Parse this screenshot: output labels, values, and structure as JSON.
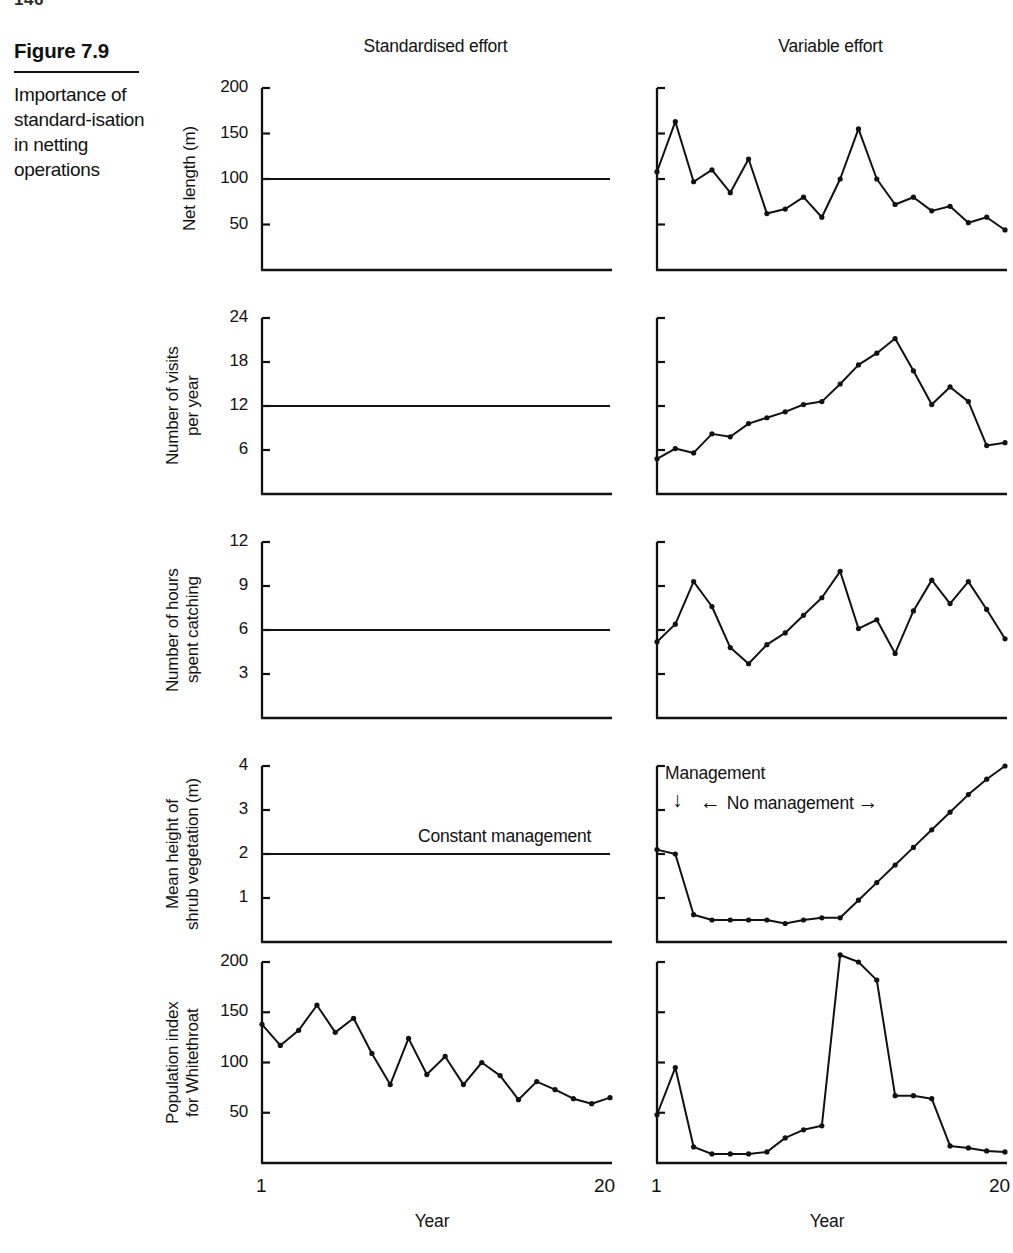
{
  "page_number_fragment": "146",
  "caption": {
    "figure_number": "Figure 7.9",
    "text": "Importance of standard-isation in netting operations"
  },
  "headers": {
    "left": "Standardised effort",
    "right": "Variable effort"
  },
  "xaxis": {
    "title": "Year",
    "first_tick": "1",
    "last_tick": "20"
  },
  "annotations": {
    "constant_management": "Constant management",
    "management": "Management",
    "no_management": "No management",
    "down_arrow": "↓",
    "left_arrow": "←",
    "right_arrow": "→"
  },
  "chart_data": [
    {
      "id": "net-length",
      "type": "line",
      "title": "",
      "ylabel": "Net length (m)",
      "xlabel": "Year",
      "ylim": [
        0,
        200
      ],
      "xlim": [
        1,
        20
      ],
      "yticks": [
        50,
        100,
        150,
        200
      ],
      "ytick_labels": [
        "50",
        "100",
        "150",
        "200"
      ],
      "grid": false,
      "panels": [
        {
          "name": "Standardised effort",
          "x": [
            1,
            20
          ],
          "values": [
            100,
            100
          ],
          "markers": false
        },
        {
          "name": "Variable effort",
          "x": [
            1,
            2,
            3,
            4,
            5,
            6,
            7,
            8,
            9,
            10,
            11,
            12,
            13,
            14,
            15,
            16,
            17,
            18,
            19,
            20
          ],
          "values": [
            108,
            163,
            97,
            110,
            85,
            122,
            62,
            67,
            80,
            58,
            100,
            155,
            100,
            72,
            80,
            65,
            70,
            52,
            58,
            44
          ],
          "markers": true
        }
      ]
    },
    {
      "id": "visits-per-year",
      "type": "line",
      "title": "",
      "ylabel": "Number of visits\nper year",
      "xlabel": "Year",
      "ylim": [
        0,
        24
      ],
      "xlim": [
        1,
        20
      ],
      "yticks": [
        6,
        12,
        18,
        24
      ],
      "ytick_labels": [
        "6",
        "12",
        "18",
        "24"
      ],
      "grid": false,
      "panels": [
        {
          "name": "Standardised effort",
          "x": [
            1,
            20
          ],
          "values": [
            12,
            12
          ],
          "markers": false
        },
        {
          "name": "Variable effort",
          "x": [
            1,
            2,
            3,
            4,
            5,
            6,
            7,
            8,
            9,
            10,
            11,
            12,
            13,
            14,
            15,
            16,
            17,
            18,
            19,
            20
          ],
          "values": [
            4.8,
            6.2,
            5.6,
            8.2,
            7.8,
            9.6,
            10.4,
            11.2,
            12.2,
            12.6,
            15.0,
            17.6,
            19.2,
            21.2,
            16.8,
            12.2,
            14.6,
            12.6,
            6.6,
            7.0
          ],
          "markers": true
        }
      ]
    },
    {
      "id": "hours-catching",
      "type": "line",
      "title": "",
      "ylabel": "Number of hours\nspent catching",
      "xlabel": "Year",
      "ylim": [
        0,
        12
      ],
      "xlim": [
        1,
        20
      ],
      "yticks": [
        3,
        6,
        9,
        12
      ],
      "ytick_labels": [
        "3",
        "6",
        "9",
        "12"
      ],
      "grid": false,
      "panels": [
        {
          "name": "Standardised effort",
          "x": [
            1,
            20
          ],
          "values": [
            6,
            6
          ],
          "markers": false
        },
        {
          "name": "Variable effort",
          "x": [
            1,
            2,
            3,
            4,
            5,
            6,
            7,
            8,
            9,
            10,
            11,
            12,
            13,
            14,
            15,
            16,
            17,
            18,
            19,
            20
          ],
          "values": [
            5.2,
            6.4,
            9.3,
            7.6,
            4.8,
            3.7,
            5.0,
            5.8,
            7.0,
            8.2,
            10.0,
            6.1,
            6.7,
            4.4,
            7.3,
            9.4,
            7.8,
            9.3,
            7.4,
            5.4
          ],
          "markers": true
        }
      ]
    },
    {
      "id": "shrub-height",
      "type": "line",
      "title": "",
      "ylabel": "Mean height of\nshrub vegetation (m)",
      "xlabel": "Year",
      "ylim": [
        0,
        4
      ],
      "xlim": [
        1,
        20
      ],
      "yticks": [
        1,
        2,
        3,
        4
      ],
      "ytick_labels": [
        "1",
        "2",
        "3",
        "4"
      ],
      "grid": false,
      "panels": [
        {
          "name": "Standardised effort",
          "x": [
            1,
            20
          ],
          "values": [
            2,
            2
          ],
          "markers": false,
          "annotation": "Constant management"
        },
        {
          "name": "Variable effort",
          "x": [
            1,
            2,
            3,
            4,
            5,
            6,
            7,
            8,
            9,
            10,
            11,
            12,
            13,
            14,
            15,
            16,
            17,
            18,
            19,
            20
          ],
          "values": [
            2.1,
            2.0,
            0.62,
            0.5,
            0.5,
            0.5,
            0.5,
            0.42,
            0.5,
            0.55,
            0.55,
            0.95,
            1.35,
            1.75,
            2.15,
            2.55,
            2.95,
            3.35,
            3.7,
            4.0
          ],
          "markers": true,
          "annotation": "No management"
        }
      ]
    },
    {
      "id": "whitethroat-index",
      "type": "line",
      "title": "",
      "ylabel": "Population index\nfor Whitethroat",
      "xlabel": "Year",
      "ylim": [
        0,
        200
      ],
      "xlim": [
        1,
        20
      ],
      "yticks": [
        50,
        100,
        150,
        200
      ],
      "ytick_labels": [
        "50",
        "100",
        "150",
        "200"
      ],
      "grid": false,
      "panels": [
        {
          "name": "Standardised effort",
          "x": [
            1,
            2,
            3,
            4,
            5,
            6,
            7,
            8,
            9,
            10,
            11,
            12,
            13,
            14,
            15,
            16,
            17,
            18,
            19,
            20
          ],
          "values": [
            138,
            117,
            132,
            157,
            130,
            144,
            109,
            78,
            124,
            88,
            106,
            78,
            100,
            87,
            63,
            81,
            73,
            64,
            59,
            65
          ],
          "markers": true
        },
        {
          "name": "Variable effort",
          "x": [
            1,
            2,
            3,
            4,
            5,
            6,
            7,
            8,
            9,
            10,
            11,
            12,
            13,
            14,
            15,
            16,
            17,
            18,
            19,
            20
          ],
          "values": [
            48,
            95,
            16,
            9,
            9,
            9,
            11,
            25,
            33,
            37,
            207,
            200,
            182,
            67,
            67,
            64,
            17,
            15,
            12,
            11
          ],
          "markers": true
        }
      ]
    }
  ]
}
